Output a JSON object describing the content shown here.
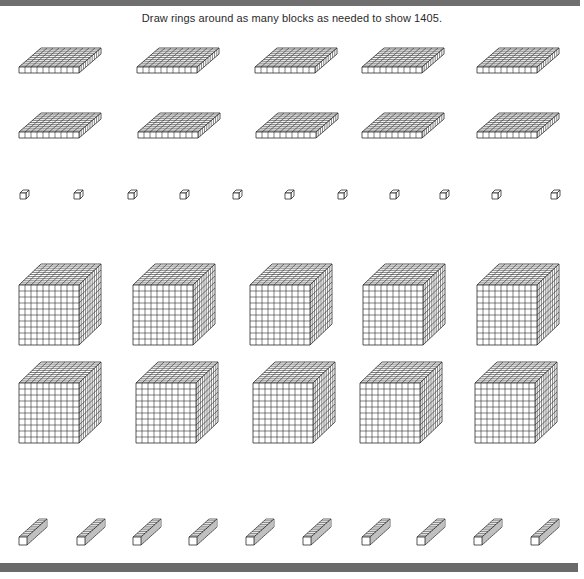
{
  "worksheet": {
    "instruction": "Draw rings around as many blocks as needed to show 1405.",
    "target_number": 1405,
    "stroke_color": "#2b2b2b",
    "top_bar_color": "#6f6f6f",
    "bottom_bar_color": "#6a6a6a"
  },
  "blocks": {
    "flats": {
      "label": "hundreds-flat",
      "value_each": 100,
      "count": 10,
      "width": 60,
      "height": 6,
      "depth_dx": 22,
      "depth_dy": -19,
      "positions": [
        {
          "x": 19,
          "y": 67
        },
        {
          "x": 137,
          "y": 67
        },
        {
          "x": 255,
          "y": 67
        },
        {
          "x": 362,
          "y": 67
        },
        {
          "x": 477,
          "y": 67
        },
        {
          "x": 19,
          "y": 132
        },
        {
          "x": 138,
          "y": 132
        },
        {
          "x": 256,
          "y": 132
        },
        {
          "x": 362,
          "y": 132
        },
        {
          "x": 477,
          "y": 132
        }
      ]
    },
    "units": {
      "label": "unit-cube",
      "value_each": 1,
      "count": 11,
      "size": 6,
      "depth_dx": 3,
      "depth_dy": -3,
      "positions": [
        {
          "x": 20,
          "y": 193
        },
        {
          "x": 74,
          "y": 193
        },
        {
          "x": 128,
          "y": 193
        },
        {
          "x": 180,
          "y": 193
        },
        {
          "x": 233,
          "y": 193
        },
        {
          "x": 285,
          "y": 193
        },
        {
          "x": 338,
          "y": 193
        },
        {
          "x": 390,
          "y": 193
        },
        {
          "x": 440,
          "y": 193
        },
        {
          "x": 492,
          "y": 193
        },
        {
          "x": 551,
          "y": 193
        }
      ]
    },
    "cubes": {
      "label": "thousands-cube",
      "value_each": 1000,
      "count": 10,
      "size": 60,
      "depth_dx": 22,
      "depth_dy": -21,
      "positions": [
        {
          "x": 19,
          "y": 285
        },
        {
          "x": 133,
          "y": 285
        },
        {
          "x": 250,
          "y": 285
        },
        {
          "x": 363,
          "y": 285
        },
        {
          "x": 477,
          "y": 285
        },
        {
          "x": 19,
          "y": 383
        },
        {
          "x": 136,
          "y": 383
        },
        {
          "x": 253,
          "y": 383
        },
        {
          "x": 360,
          "y": 383
        },
        {
          "x": 475,
          "y": 383
        }
      ]
    },
    "rods": {
      "label": "tens-rod",
      "value_each": 10,
      "count": 10,
      "size": 8,
      "length_dx": 20,
      "length_dy": -18,
      "positions": [
        {
          "x": 19,
          "y": 537
        },
        {
          "x": 77,
          "y": 537
        },
        {
          "x": 133,
          "y": 537
        },
        {
          "x": 189,
          "y": 537
        },
        {
          "x": 246,
          "y": 537
        },
        {
          "x": 303,
          "y": 537
        },
        {
          "x": 362,
          "y": 537
        },
        {
          "x": 417,
          "y": 537
        },
        {
          "x": 474,
          "y": 537
        },
        {
          "x": 531,
          "y": 537
        }
      ]
    }
  }
}
